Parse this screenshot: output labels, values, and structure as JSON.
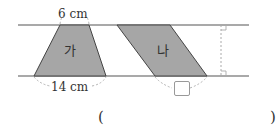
{
  "figure": {
    "shape_a": {
      "label": "가",
      "top_label": "6 cm",
      "bottom_label": "14 cm"
    },
    "shape_b": {
      "label": "나",
      "bottom_label_box": ""
    },
    "colors": {
      "fill": "#a6a6a6",
      "line": "#444444",
      "dashed": "#aaaaaa"
    }
  },
  "answer": {
    "open_paren": "(",
    "close_paren": ")"
  }
}
